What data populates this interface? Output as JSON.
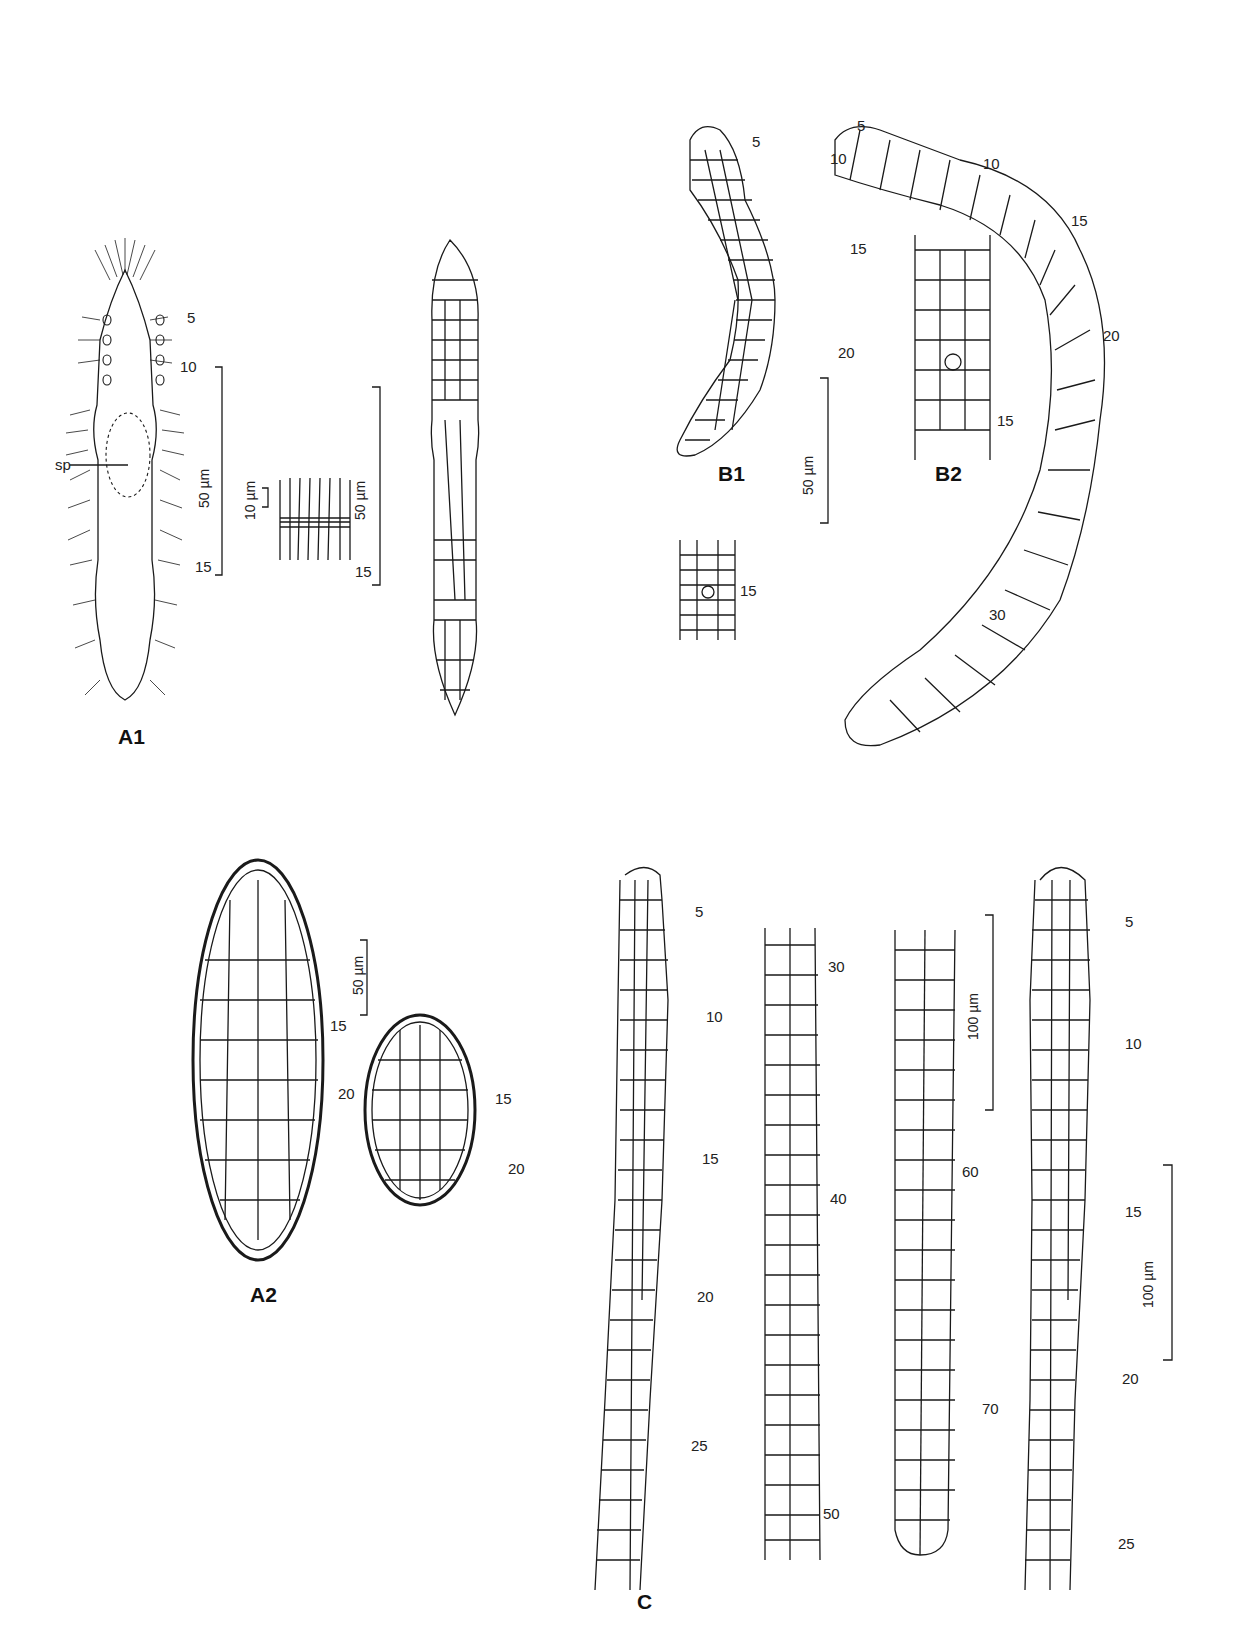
{
  "figure": {
    "panels": {
      "A1": "A1",
      "A2": "A2",
      "B1": "B1",
      "B2": "B2",
      "C": "C"
    },
    "a1": {
      "segment_labels": [
        "5",
        "10",
        "15"
      ],
      "annotation": "sp",
      "detail_label": "15",
      "scale_main": "50 µm",
      "scale_detail": "10 µm",
      "scale_right": "50 µm"
    },
    "a2": {
      "scale": "50 µm",
      "left_labels": [
        "15",
        "20"
      ],
      "right_labels": [
        "15",
        "20"
      ]
    },
    "b1": {
      "segment_labels": [
        "5",
        "10",
        "15",
        "20"
      ],
      "detail_label": "15",
      "scale": "50 µm"
    },
    "b2": {
      "segment_labels": [
        "5",
        "10",
        "15",
        "20",
        "30"
      ],
      "detail_label": "15"
    },
    "c": {
      "strand1_labels": [
        "5",
        "10",
        "15",
        "20",
        "25"
      ],
      "strand2_labels": [
        "30",
        "40",
        "50"
      ],
      "strand3_labels": [
        "60",
        "70"
      ],
      "strand4_labels": [
        "5",
        "10",
        "15",
        "20",
        "25"
      ],
      "scale_top": "100 µm",
      "scale_bottom": "100 µm"
    }
  },
  "colors": {
    "ink": "#1a1a1a",
    "background": "#ffffff"
  }
}
